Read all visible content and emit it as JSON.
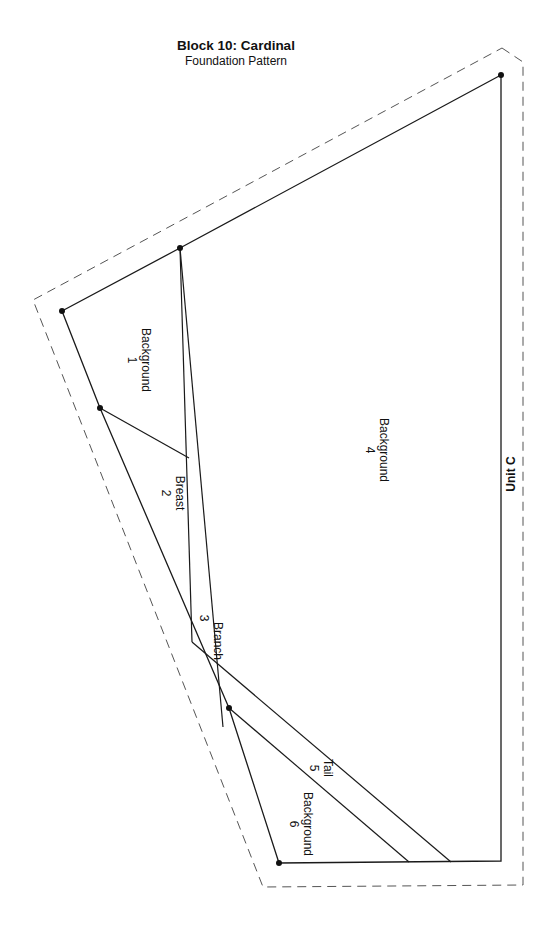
{
  "header": {
    "title": "Block 10: Cardinal",
    "subtitle": "Foundation Pattern"
  },
  "unit_label": "Unit C",
  "pieces": [
    {
      "number": "1",
      "name": "Background"
    },
    {
      "number": "2",
      "name": "Breast"
    },
    {
      "number": "3",
      "name": "Branch"
    },
    {
      "number": "4",
      "name": "Background"
    },
    {
      "number": "5",
      "name": "Tail"
    },
    {
      "number": "6",
      "name": "Background"
    }
  ],
  "colors": {
    "line": "#1a1a1a",
    "seam_allowance": "#555555",
    "background": "#ffffff"
  }
}
